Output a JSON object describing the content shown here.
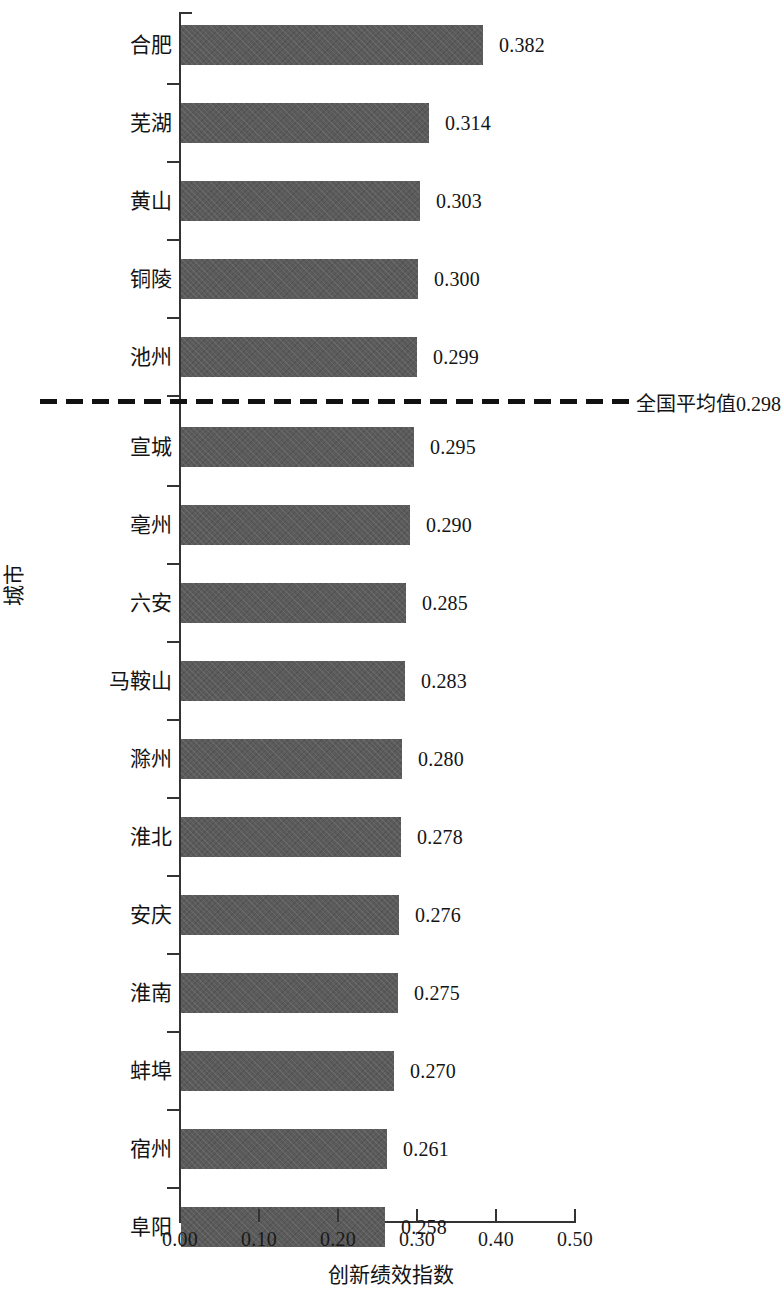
{
  "chart_data": {
    "type": "bar",
    "orientation": "horizontal",
    "title": "",
    "xlabel": "创新绩效指数",
    "ylabel": "城市",
    "xlim": [
      0.0,
      0.5
    ],
    "grid": false,
    "legend": "none",
    "bar_color": "#5b5b5b",
    "tick_labels": [
      "0.00",
      "0.10",
      "0.20",
      "0.30",
      "0.40",
      "0.50"
    ],
    "tick_values": [
      0.0,
      0.1,
      0.2,
      0.3,
      0.4,
      0.5
    ],
    "categories": [
      "合肥",
      "芜湖",
      "黄山",
      "铜陵",
      "池州",
      "宣城",
      "亳州",
      "六安",
      "马鞍山",
      "滁州",
      "淮北",
      "安庆",
      "淮南",
      "蚌埠",
      "宿州",
      "阜阳"
    ],
    "values": [
      0.382,
      0.314,
      0.303,
      0.3,
      0.299,
      0.295,
      0.29,
      0.285,
      0.283,
      0.28,
      0.278,
      0.276,
      0.275,
      0.27,
      0.261,
      0.258
    ],
    "value_labels": [
      "0.382",
      "0.314",
      "0.303",
      "0.300",
      "0.299",
      "0.295",
      "0.290",
      "0.285",
      "0.283",
      "0.280",
      "0.278",
      "0.276",
      "0.275",
      "0.270",
      "0.261",
      "0.258"
    ],
    "annotations": [
      {
        "name": "national-average-line",
        "label": "全国平均值0.298",
        "value": 0.298,
        "style": "dashed-horizontal",
        "color": "#111111",
        "after_category": "池州"
      }
    ]
  }
}
